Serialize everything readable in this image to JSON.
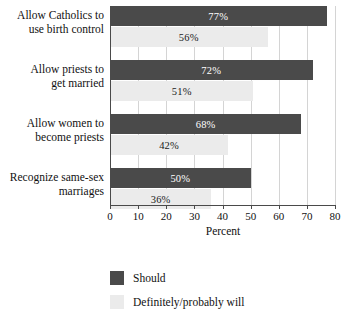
{
  "chart_data": {
    "type": "bar",
    "orientation": "horizontal",
    "title": "",
    "xlabel": "Percent",
    "ylabel": "",
    "xlim": [
      0,
      80
    ],
    "xticks": [
      0,
      10,
      20,
      30,
      40,
      50,
      60,
      70,
      80
    ],
    "grid": "vertical",
    "legend_position": "bottom-left",
    "categories": [
      "Allow Catholics to use birth control",
      "Allow priests to get married",
      "Allow women to become priests",
      "Recognize same-sex marriages"
    ],
    "category_lines": [
      [
        "Allow Catholics to",
        "use birth control"
      ],
      [
        "Allow priests to",
        "get married"
      ],
      [
        "Allow women to",
        "become priests"
      ],
      [
        "Recognize same-sex",
        "marriages"
      ]
    ],
    "series": [
      {
        "name": "Should",
        "color": "#4a4a4a",
        "values": [
          77,
          72,
          68,
          50
        ],
        "labels": [
          "77%",
          "72%",
          "68%",
          "50%"
        ]
      },
      {
        "name": "Definitely/probably will",
        "color": "#ebebeb",
        "values": [
          56,
          51,
          42,
          36
        ],
        "labels": [
          "56%",
          "51%",
          "42%",
          "36%"
        ]
      }
    ]
  },
  "legend": {
    "items": [
      {
        "label": "Should",
        "swatch": "should"
      },
      {
        "label": "Definitely/probably will",
        "swatch": "will"
      }
    ]
  },
  "axis": {
    "x_title": "Percent",
    "tick_labels": [
      "0",
      "10",
      "20",
      "30",
      "40",
      "50",
      "60",
      "70",
      "80"
    ]
  }
}
